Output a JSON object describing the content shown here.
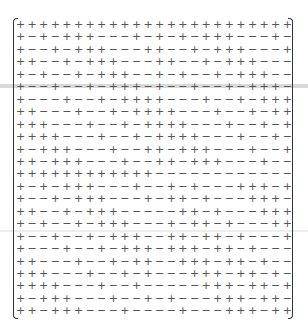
{
  "figure": {
    "type": "matrix",
    "rows": 24,
    "cols": 24,
    "bracket": "parentheses",
    "symbols": {
      "plus": "+",
      "minus": "−"
    },
    "matrix": [
      "++++++++++++++++++++++++",
      "+-+-+++---+-+-+-+++---+-",
      "+--+-+++---++--+-+++---+",
      "++--+-+++---++--+-+++---",
      "+-+--+-+++--+-+--+-+++--",
      "+--+--+-+++-+--+--+-+++-",
      "+---+--+-++++---+--+-+++",
      "++---+--+-++++---+--+-++",
      "+++---+--+-++++---+--+-+",
      "++++---+--+-++++---+--+-",
      "+-+++---+--++-+++---+--+",
      "++-+++---+--++-+++---+--",
      "++++++++++++------------",
      "+-+-+++---+--+-+---+++-+",
      "+--+-+++---+-++-+---+++-",
      "++--+-+++-----++-+---+++",
      "+-+--+-+++---+-++-+---++",
      "+--+--+-+++--++-++-+---+",
      "+---+--+-+++-+++-++-+---",
      "++---+--+-++--+++-++-+--",
      "+++---+--+-+---+++-++-+-",
      "++++---+--+-----+++-++-+",
      "+-+++---+--+-+---+++-++-",
      "++-+++---+----+---+++-++"
    ]
  }
}
